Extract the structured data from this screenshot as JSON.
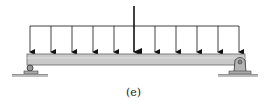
{
  "diagram": {
    "type": "simply-supported beam with uniform distributed load and central point load",
    "caption": "(e)",
    "colors": {
      "beam_fill": "#c9c9c9",
      "beam_edge": "#555555",
      "arrow": "#111111",
      "ground": "#bdbdbd"
    },
    "supports": [
      {
        "position": "left",
        "type": "roller"
      },
      {
        "position": "right",
        "type": "pin"
      }
    ],
    "loads": {
      "distributed_arrow_count": 10,
      "point_load": "central concentrated force"
    }
  }
}
